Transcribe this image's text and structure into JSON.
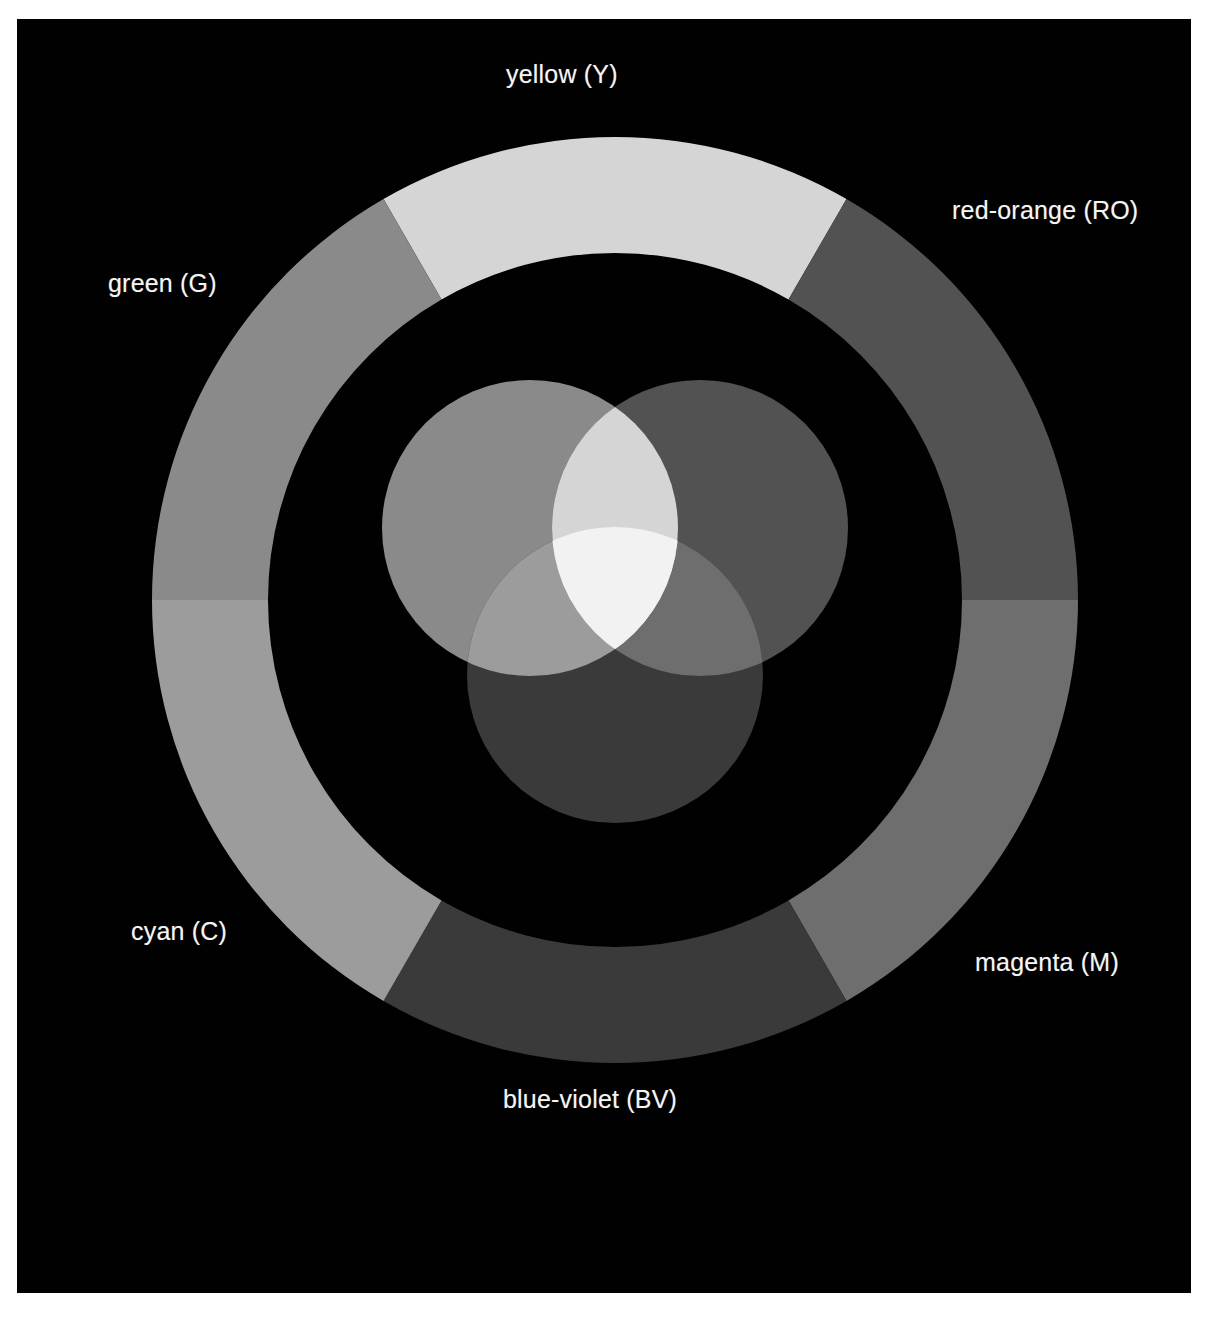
{
  "figure": {
    "background_color": "#ffffff",
    "panel_color": "#010101"
  },
  "color_wheel": {
    "type": "donut-ring",
    "center_x": 598,
    "center_y": 581,
    "outer_radius": 463,
    "inner_radius": 347,
    "segments": [
      {
        "id": "yellow",
        "label": "yellow (Y)",
        "abbr": "Y",
        "color": "#d5d5d5",
        "start_angle_deg": -120,
        "end_angle_deg": -60,
        "label_position": "top"
      },
      {
        "id": "red-orange",
        "label": "red-orange (RO)",
        "abbr": "RO",
        "color": "#525252",
        "start_angle_deg": -60,
        "end_angle_deg": 0,
        "label_position": "top-right"
      },
      {
        "id": "magenta",
        "label": "magenta (M)",
        "abbr": "M",
        "color": "#6e6e6e",
        "start_angle_deg": 0,
        "end_angle_deg": 60,
        "label_position": "bottom-right"
      },
      {
        "id": "blue-violet",
        "label": "blue-violet (BV)",
        "abbr": "BV",
        "color": "#3a3a3a",
        "start_angle_deg": 60,
        "end_angle_deg": 120,
        "label_position": "bottom"
      },
      {
        "id": "cyan",
        "label": "cyan (C)",
        "abbr": "C",
        "color": "#9c9c9c",
        "start_angle_deg": 120,
        "end_angle_deg": 180,
        "label_position": "bottom-left"
      },
      {
        "id": "green",
        "label": "green (G)",
        "abbr": "G",
        "color": "#8a8a8a",
        "start_angle_deg": 180,
        "end_angle_deg": 240,
        "label_position": "top-left"
      }
    ]
  },
  "venn": {
    "type": "additive-rgb-venn",
    "circle_radius": 148,
    "circles": [
      {
        "id": "green",
        "primary": "G",
        "center_x": 513,
        "center_y": 509,
        "color": "#8a8a8a"
      },
      {
        "id": "red",
        "primary": "R",
        "center_x": 683,
        "center_y": 509,
        "color": "#525252"
      },
      {
        "id": "blue",
        "primary": "B",
        "center_x": 598,
        "center_y": 656,
        "color": "#3a3a3a"
      }
    ],
    "overlaps": [
      {
        "id": "green-red",
        "mix": "G+R",
        "result": "yellow",
        "color": "#d5d5d5"
      },
      {
        "id": "green-blue",
        "mix": "G+B",
        "result": "cyan",
        "color": "#9c9c9c"
      },
      {
        "id": "red-blue",
        "mix": "R+B",
        "result": "magenta",
        "color": "#6e6e6e"
      },
      {
        "id": "green-red-blue",
        "mix": "G+R+B",
        "result": "white",
        "color": "#f2f2f2"
      }
    ]
  },
  "labels": {
    "yellow": "yellow (Y)",
    "red_orange": "red-orange (RO)",
    "green": "green (G)",
    "cyan": "cyan (C)",
    "magenta": "magenta (M)",
    "blue_violet": "blue-violet (BV)",
    "text_color": "#f4f4f4"
  }
}
